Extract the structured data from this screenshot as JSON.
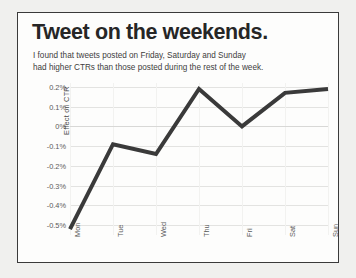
{
  "slide": {
    "title": "Tweet on the weekends.",
    "subtitle": "I found that tweets posted on Friday, Saturday and Sunday had higher CTRs than those posted during the rest of the week.",
    "subtitle_line1": "I found that tweets posted on Friday, Saturday and Sunday",
    "subtitle_line2": "had higher CTRs than those posted during the rest of the week.",
    "background_color": "#f0f0ee",
    "panel_color": "#fdfdfc",
    "border_color": "#3a3a3a"
  },
  "chart_data": {
    "type": "line",
    "title": "Tweet on the weekends.",
    "subtitle": "I found that tweets posted on Friday, Saturday and Sunday had higher CTRs than those posted during the rest of the week.",
    "categories": [
      "Mon",
      "Tue",
      "Wed",
      "Thu",
      "Fri",
      "Sat",
      "Sun"
    ],
    "values": [
      -0.52,
      -0.09,
      -0.14,
      0.19,
      0.0,
      0.17,
      0.19
    ],
    "series": [
      {
        "name": "Effect on CTR",
        "values": [
          -0.52,
          -0.09,
          -0.14,
          0.19,
          0.0,
          0.17,
          0.19
        ],
        "color": "#3a3a3a"
      }
    ],
    "xlabel": "",
    "ylabel": "Effect on CTR",
    "ylim": [
      -0.55,
      0.22
    ],
    "ytick_values": [
      0.2,
      0.1,
      0.0,
      -0.1,
      -0.2,
      -0.3,
      -0.4,
      -0.5
    ],
    "ytick_labels": [
      "0.2%",
      "0.1%",
      "0%",
      "-0.1%",
      "-0.2%",
      "-0.3%",
      "-0.4%",
      "-0.5%"
    ],
    "unit": "%",
    "grid": true,
    "legend": false,
    "line_color": "#3a3a3a",
    "line_width": 4,
    "zero_line": 0.0,
    "xtick_rotation": -90,
    "ytick_label_color": "#5a5a5a"
  }
}
